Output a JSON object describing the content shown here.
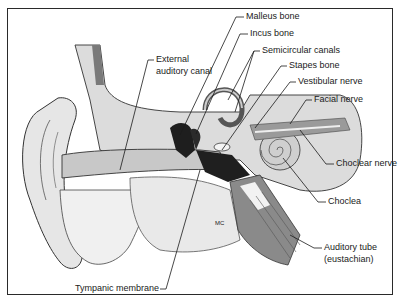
{
  "figure": {
    "labels": {
      "malleus": "Malleus bone",
      "incus": "Incus bone",
      "semicircular": "Semicircular canals",
      "stapes": "Stapes bone",
      "vestibular": "Vestibular nerve",
      "facial": "Facial nerve",
      "external_1": "External",
      "external_2": "auditory canal",
      "choclear_nerve": "Choclear nerve",
      "choclea": "Choclea",
      "auditory_1": "Auditory tube",
      "auditory_2": "(eustachian)",
      "mc": "MC",
      "tympanic": "Tympanic membrane"
    },
    "colors": {
      "ink": "#1a1a1a",
      "bone": "#d6d6d6",
      "tissue": "#ededed",
      "dark": "#2b2b2b",
      "mid": "#9a9a9a"
    }
  }
}
